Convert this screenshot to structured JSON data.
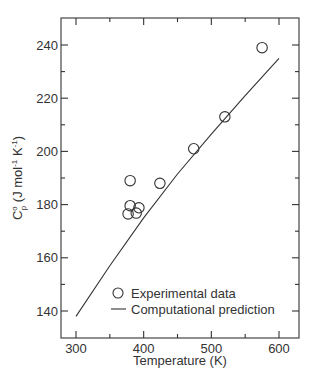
{
  "chart_data": {
    "type": "scatter",
    "title": "",
    "xlabel": "Temperature (K)",
    "ylabel": "C°p (J mol⁻¹ K⁻¹)",
    "ylabel_parts": {
      "symbol": "C",
      "sup": "o",
      "sub": "p",
      "units_prefix": " (J mol",
      "exp1": "-1",
      "units_mid": " K",
      "exp2": "-1",
      "units_suffix": ")"
    },
    "xlim": [
      280,
      630
    ],
    "ylim": [
      130,
      250
    ],
    "xticks": [
      300,
      400,
      500,
      600
    ],
    "xminor": [
      350,
      450,
      550
    ],
    "yticks": [
      140,
      160,
      180,
      200,
      220,
      240
    ],
    "yminor": [
      150,
      170,
      190,
      210,
      230
    ],
    "grid": false,
    "legend_position": "lower right",
    "series": [
      {
        "name": "Experimental data",
        "kind": "scatter",
        "marker": "open-circle",
        "points": [
          {
            "x": 380,
            "y": 189
          },
          {
            "x": 424,
            "y": 188
          },
          {
            "x": 380,
            "y": 179.6
          },
          {
            "x": 393,
            "y": 178.8
          },
          {
            "x": 377,
            "y": 176.5
          },
          {
            "x": 389,
            "y": 176.8
          },
          {
            "x": 474,
            "y": 201
          },
          {
            "x": 520,
            "y": 213
          },
          {
            "x": 575,
            "y": 239
          }
        ]
      },
      {
        "name": "Computational prediction",
        "kind": "line",
        "points": [
          {
            "x": 300,
            "y": 138
          },
          {
            "x": 350,
            "y": 157
          },
          {
            "x": 400,
            "y": 175
          },
          {
            "x": 450,
            "y": 191.5
          },
          {
            "x": 500,
            "y": 206.5
          },
          {
            "x": 550,
            "y": 221
          },
          {
            "x": 600,
            "y": 235
          }
        ]
      }
    ]
  }
}
